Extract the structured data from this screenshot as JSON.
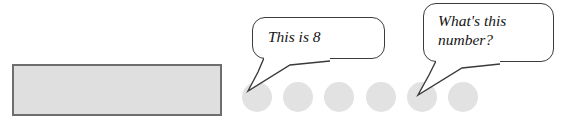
{
  "figure": {
    "kind": "math-illustration",
    "background_color": "#ffffff"
  },
  "bar": {
    "label": "grey-rectangle",
    "fill_color": "#dfdfdf",
    "border_color": "#6e6e6e"
  },
  "dots": {
    "count": 6,
    "fill_color": "#e2e2e2",
    "diameter_px": 30,
    "spacing_px": 41,
    "items": [
      {
        "index": 1,
        "x": 0
      },
      {
        "index": 2,
        "x": 41
      },
      {
        "index": 3,
        "x": 82
      },
      {
        "index": 4,
        "x": 124
      },
      {
        "index": 5,
        "x": 165
      },
      {
        "index": 6,
        "x": 206
      }
    ]
  },
  "bubbles": [
    {
      "id": "bubble-0",
      "lines": [
        "This is 8"
      ],
      "points_to_dot": 1,
      "border_color": "#3b3b3b"
    },
    {
      "id": "bubble-1",
      "lines": [
        "What's this",
        "number?"
      ],
      "points_to_dot": 4,
      "border_color": "#3b3b3b"
    }
  ]
}
